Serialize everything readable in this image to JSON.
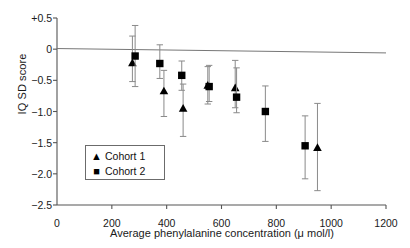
{
  "chart_data": {
    "type": "scatter",
    "title": "",
    "xlabel": "Average phenylalanine concentration (μ mol/l)",
    "ylabel": "IQ SD score",
    "xlim": [
      0,
      1200
    ],
    "ylim": [
      -2.5,
      0.5
    ],
    "xticks": [
      0,
      200,
      400,
      600,
      800,
      1000,
      1200
    ],
    "xticklabels": [
      "0",
      "200",
      "400",
      "600",
      "800",
      "1000",
      "1200"
    ],
    "yticks": [
      0.5,
      0,
      -0.5,
      -1.0,
      -1.5,
      -2.0,
      -2.5
    ],
    "yticklabels": [
      "+0.5",
      "0",
      "−0.5",
      "−1.0",
      "−1.5",
      "−2.0",
      "−2.5"
    ],
    "grid": false,
    "legend_position": "inside-lower-left",
    "reference_line": {
      "label": "regression-line",
      "x": [
        0,
        1200
      ],
      "y": [
        0.01,
        -0.06
      ],
      "color": "#777777"
    },
    "series": [
      {
        "name": "Cohort 1",
        "marker": "triangle",
        "color": "#000000",
        "points": [
          {
            "x": 275,
            "y": -0.22,
            "ci_low": -0.52,
            "ci_high": 0.21
          },
          {
            "x": 390,
            "y": -0.67,
            "ci_low": -1.08,
            "ci_high": -0.34
          },
          {
            "x": 460,
            "y": -0.95,
            "ci_low": -1.4,
            "ci_high": -0.56
          },
          {
            "x": 550,
            "y": -0.58,
            "ci_low": -0.88,
            "ci_high": -0.28
          },
          {
            "x": 650,
            "y": -0.62,
            "ci_low": -0.94,
            "ci_high": -0.18
          },
          {
            "x": 950,
            "y": -1.58,
            "ci_low": -2.27,
            "ci_high": -0.87
          }
        ]
      },
      {
        "name": "Cohort 2",
        "marker": "square",
        "color": "#000000",
        "points": [
          {
            "x": 285,
            "y": -0.11,
            "ci_low": -0.6,
            "ci_high": 0.38
          },
          {
            "x": 375,
            "y": -0.23,
            "ci_low": -0.47,
            "ci_high": 0.07
          },
          {
            "x": 455,
            "y": -0.42,
            "ci_low": -0.66,
            "ci_high": -0.19
          },
          {
            "x": 555,
            "y": -0.6,
            "ci_low": -0.84,
            "ci_high": -0.26
          },
          {
            "x": 655,
            "y": -0.77,
            "ci_low": -1.02,
            "ci_high": -0.3
          },
          {
            "x": 760,
            "y": -1.0,
            "ci_low": -1.48,
            "ci_high": -0.59
          },
          {
            "x": 905,
            "y": -1.55,
            "ci_low": -2.08,
            "ci_high": -1.07
          }
        ]
      }
    ],
    "legend": [
      {
        "label": "Cohort 1",
        "marker": "▲"
      },
      {
        "label": "Cohort 2",
        "marker": "■"
      }
    ]
  }
}
